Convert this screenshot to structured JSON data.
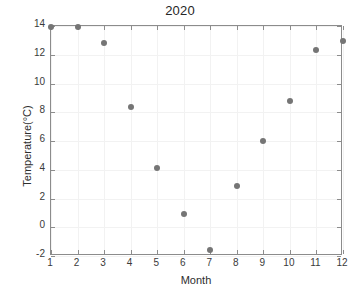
{
  "chart_data": {
    "type": "scatter",
    "title": "2020",
    "xlabel": "Month",
    "ylabel": "Temperature(°C)",
    "x": [
      1,
      2,
      3,
      4,
      5,
      6,
      7,
      8,
      9,
      10,
      11,
      12
    ],
    "values": [
      13.9,
      13.9,
      12.85,
      8.35,
      4.15,
      0.95,
      -1.6,
      2.9,
      6.0,
      8.75,
      12.3,
      12.95
    ],
    "categories": [
      "1",
      "2",
      "3",
      "4",
      "5",
      "6",
      "7",
      "8",
      "9",
      "10",
      "11",
      "12"
    ],
    "xtick_labels": [
      "1",
      "2",
      "3",
      "4",
      "5",
      "6",
      "7",
      "8",
      "9",
      "10",
      "11",
      "12"
    ],
    "ytick_labels": [
      "-2",
      "0",
      "2",
      "4",
      "6",
      "8",
      "10",
      "12",
      "14"
    ],
    "yticks": [
      -2,
      0,
      2,
      4,
      6,
      8,
      10,
      12,
      14
    ],
    "xlim": [
      1,
      12
    ],
    "ylim": [
      -2,
      14
    ],
    "grid": true,
    "legend": null,
    "marker_color": "#757575",
    "axis_color": "#8c8c8c",
    "grid_color": "#f2f2f2",
    "text_color": "#2e2e2e"
  }
}
